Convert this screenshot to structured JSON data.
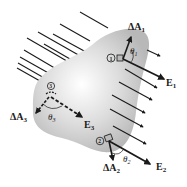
{
  "figure": {
    "surface_color": "#c4c4c4",
    "field_line_color": "#1a1a1a"
  },
  "labels": {
    "dA1": "ΔA",
    "dA1_sub": "1",
    "dA2": "ΔA",
    "dA2_sub": "2",
    "dA3": "ΔA",
    "dA3_sub": "3",
    "E1": "E",
    "E1_sub": "1",
    "E2": "E",
    "E2_sub": "2",
    "E3": "E",
    "E3_sub": "3",
    "theta1": "θ",
    "theta1_sub": "1",
    "theta2": "θ",
    "theta2_sub": "2",
    "theta3": "θ",
    "theta3_sub": "3",
    "patch1": "1",
    "patch2": "2",
    "patch3": "3"
  }
}
